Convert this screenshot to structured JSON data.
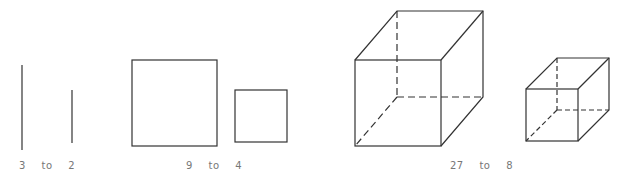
{
  "figure": {
    "groups": [
      {
        "name": "lines",
        "dimension": "1D",
        "large": 3,
        "small": 2,
        "word": "to",
        "ratio_label": "3 to 2"
      },
      {
        "name": "squares",
        "dimension": "2D",
        "large": 9,
        "small": 4,
        "word": "to",
        "ratio_label": "9 to 4"
      },
      {
        "name": "cubes",
        "dimension": "3D",
        "large": 27,
        "small": 8,
        "word": "to",
        "ratio_label": "27 to 8"
      }
    ],
    "stroke_color": "#333333",
    "label_color": "#777777"
  }
}
